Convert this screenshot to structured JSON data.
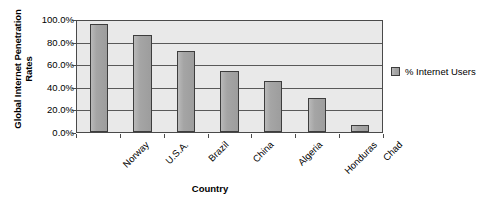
{
  "chart_data": {
    "type": "bar",
    "title": "",
    "categories": [
      "Norway",
      "U.S.A.",
      "Brazil",
      "China",
      "Algeria",
      "Honduras",
      "Chad"
    ],
    "values": [
      0.96,
      0.86,
      0.72,
      0.54,
      0.45,
      0.3,
      0.06
    ],
    "series": [
      {
        "name": "% Internet Users",
        "values": [
          0.96,
          0.86,
          0.72,
          0.54,
          0.45,
          0.3,
          0.06
        ]
      }
    ],
    "xlabel": "Country",
    "ylabel": "Global Internet Penetration Rates",
    "ylim": [
      0,
      1
    ],
    "ytick_labels": [
      "100.0%",
      "80.0%",
      "60.0%",
      "40.0%",
      "20.0%",
      "0.0%"
    ],
    "ytick_values": [
      1.0,
      0.8,
      0.6,
      0.4,
      0.2,
      0.0
    ],
    "grid": true,
    "legend_position": "right",
    "legend_entries": [
      "% Internet Users"
    ],
    "bar_color": "#a5a5a5",
    "bar_border_color": "#3d3d3d",
    "plot_background": "#e9e9e9",
    "axis_color": "#4a4a4a",
    "category_label_rotation": -45
  },
  "axes": {
    "y_title_line1": "Global Internet Penetration",
    "y_title_line2": "Rates",
    "x_title": "Country"
  },
  "legend": {
    "label": "% Internet Users"
  }
}
